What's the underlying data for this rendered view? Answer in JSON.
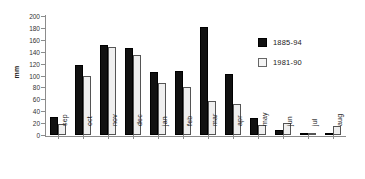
{
  "chart_data": {
    "type": "bar",
    "title": "",
    "xlabel": "",
    "ylabel": "mm",
    "ylim": [
      0,
      200
    ],
    "yticks": [
      0,
      20,
      40,
      60,
      80,
      100,
      120,
      140,
      160,
      180,
      200
    ],
    "grid": false,
    "legend_position": "right",
    "categories": [
      "sep",
      "oct",
      "nov",
      "dec",
      "jan",
      "feb",
      "mar",
      "apr",
      "may",
      "jun",
      "jul",
      "aug"
    ],
    "series": [
      {
        "name": "1885-94",
        "color": "#111111",
        "values": [
          30,
          118,
          152,
          147,
          106,
          108,
          182,
          103,
          28,
          8,
          2,
          3
        ]
      },
      {
        "name": "1981-90",
        "color": "#efefef",
        "values": [
          19,
          100,
          148,
          135,
          88,
          80,
          57,
          52,
          16,
          20,
          1,
          15
        ]
      }
    ]
  },
  "axis": {
    "y_label": "mm"
  },
  "legend": {
    "items": [
      {
        "label": "1885-94",
        "swatch": "dark"
      },
      {
        "label": "1981-90",
        "swatch": "light"
      }
    ]
  }
}
